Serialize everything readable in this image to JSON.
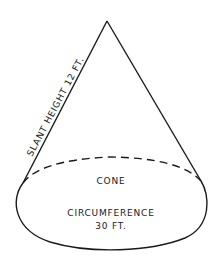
{
  "diagram": {
    "shape": "cone",
    "labels": {
      "slant": "SLANT HEIGHT 12 FT.",
      "name": "CONE",
      "circumference_label": "CIRCUMFERENCE",
      "circumference_value": "30 FT."
    },
    "colors": {
      "stroke": "#1a1a1a",
      "background": "#ffffff"
    }
  }
}
